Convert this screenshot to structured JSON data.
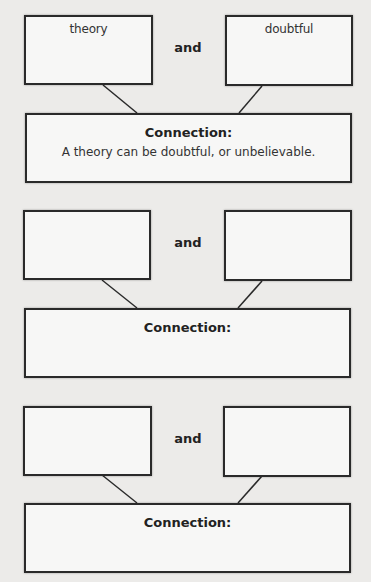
{
  "sets": [
    {
      "left_word": "theory",
      "right_word": "doubtful",
      "joiner": "and",
      "connection_label": "Connection:",
      "connection_text": "A theory can be doubtful, or unbelievable."
    },
    {
      "left_word": "",
      "right_word": "",
      "joiner": "and",
      "connection_label": "Connection:",
      "connection_text": ""
    },
    {
      "left_word": "",
      "right_word": "",
      "joiner": "and",
      "connection_label": "Connection:",
      "connection_text": ""
    }
  ]
}
